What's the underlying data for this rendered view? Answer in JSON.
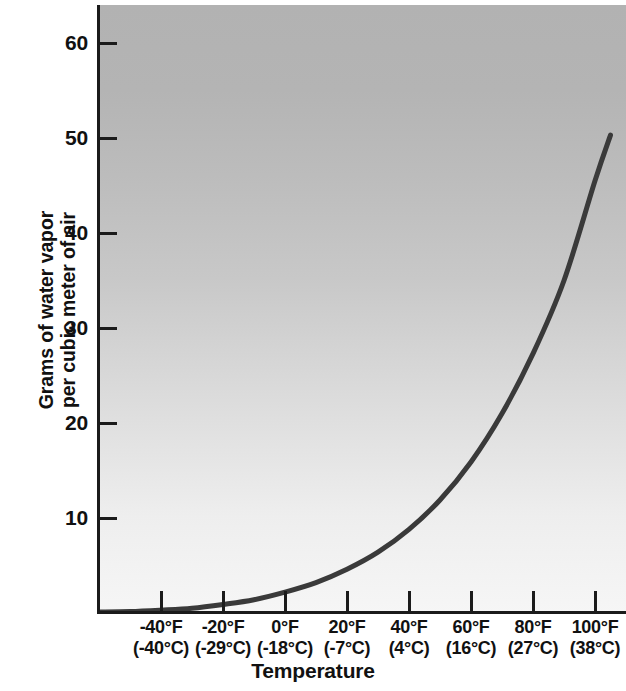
{
  "chart_data": {
    "type": "line",
    "title": "",
    "xlabel": "Temperature",
    "ylabel": "Grams of water vapor per cubic meter of air",
    "ylabel_lines": [
      "Grams of water vapor",
      "per cubic meter of air"
    ],
    "grid": false,
    "legend": "none",
    "background": "gray vertical gradient, dark at top to light at bottom",
    "line_color": "#3a3a3a",
    "axis_color": "#1b1b1b",
    "xlim": [
      -60,
      110
    ],
    "ylim": [
      0,
      64
    ],
    "yticks": [
      10,
      20,
      30,
      40,
      50,
      60
    ],
    "ytick_labels": [
      "10",
      "20",
      "30",
      "40",
      "50",
      "60"
    ],
    "xticks": [
      -40,
      -20,
      0,
      20,
      40,
      60,
      80,
      100
    ],
    "xtick_labels": [
      {
        "fahrenheit": "-40°F",
        "celsius": "(-40°C)"
      },
      {
        "fahrenheit": "-20°F",
        "celsius": "(-29°C)"
      },
      {
        "fahrenheit": "0°F",
        "celsius": "(-18°C)"
      },
      {
        "fahrenheit": "20°F",
        "celsius": "(-7°C)"
      },
      {
        "fahrenheit": "40°F",
        "celsius": "(4°C)"
      },
      {
        "fahrenheit": "60°F",
        "celsius": "(16°C)"
      },
      {
        "fahrenheit": "80°F",
        "celsius": "(27°C)"
      },
      {
        "fahrenheit": "100°F",
        "celsius": "(38°C)"
      }
    ],
    "series": [
      {
        "name": "Saturation water vapor capacity",
        "x": [
          -60,
          -50,
          -40,
          -30,
          -20,
          -10,
          0,
          10,
          20,
          30,
          40,
          50,
          60,
          70,
          80,
          90,
          100,
          105
        ],
        "values": [
          0.1,
          0.15,
          0.3,
          0.5,
          0.9,
          1.4,
          2.2,
          3.2,
          4.6,
          6.4,
          8.8,
          11.9,
          15.9,
          21.0,
          27.3,
          35.0,
          45.5,
          50.3
        ]
      }
    ]
  },
  "axes": {
    "y_title_line1": "Grams of water vapor",
    "y_title_line2": "per cubic meter of air",
    "x_title": "Temperature"
  }
}
